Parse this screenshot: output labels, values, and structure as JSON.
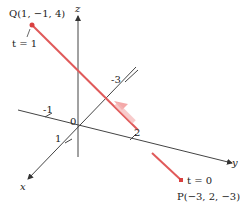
{
  "diagram": {
    "type": "3d-line-segment",
    "axes": {
      "x_label": "x",
      "y_label": "y",
      "z_label": "z",
      "origin_label": "0"
    },
    "ticks": {
      "x_pos": "1",
      "x_neg": "-1",
      "y_pos": "2",
      "y_neg": "-3"
    },
    "points": {
      "Q": {
        "label": "Q(1, −1, 4)",
        "param": "t = 1"
      },
      "P": {
        "label": "P(−3, 2, −3)",
        "param": "t = 0"
      }
    },
    "colors": {
      "segment": "#e05a5a",
      "point": "#d94040",
      "axis": "#444444"
    }
  }
}
